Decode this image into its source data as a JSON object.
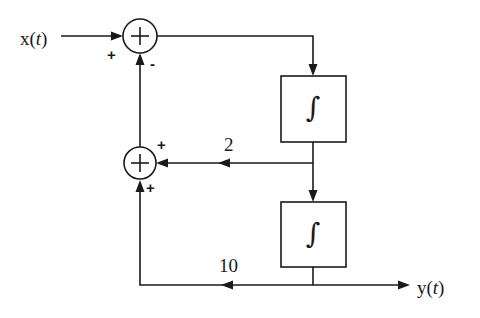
{
  "diagram": {
    "type": "block-diagram",
    "input": {
      "label_prefix": "x(",
      "label_var": "t",
      "label_suffix": ")"
    },
    "output": {
      "label_prefix": "y(",
      "label_var": "t",
      "label_suffix": ")"
    },
    "summers": [
      {
        "id": "summer-top",
        "symbol": "+",
        "input_signs": {
          "left": "+",
          "bottom": "-"
        }
      },
      {
        "id": "summer-bottom",
        "symbol": "+",
        "input_signs": {
          "right": "+",
          "bottom": "+"
        }
      }
    ],
    "blocks": [
      {
        "id": "integrator-1",
        "symbol": "∫"
      },
      {
        "id": "integrator-2",
        "symbol": "∫"
      }
    ],
    "gains": [
      {
        "id": "gain-2",
        "value": "2"
      },
      {
        "id": "gain-10",
        "value": "10"
      }
    ],
    "colors": {
      "line": "#1a1a1a",
      "background": "#ffffff"
    }
  }
}
